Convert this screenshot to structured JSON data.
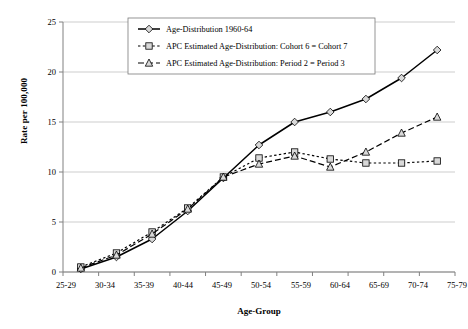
{
  "chart_data": {
    "type": "line",
    "title": "",
    "xlabel": "Age-Group",
    "ylabel": "Rate per 100,000",
    "categories": [
      "25-29",
      "30-34",
      "35-39",
      "40-44",
      "45-49",
      "50-54",
      "55-59",
      "60-64",
      "65-69",
      "70-74",
      "75-79"
    ],
    "ylim": [
      0,
      25
    ],
    "yticks": [
      0,
      5,
      10,
      15,
      20,
      25
    ],
    "grid": true,
    "legend_position": "top-center",
    "series": [
      {
        "name": "Age-Distribution 1960-64",
        "marker": "diamond",
        "line_style": "solid",
        "color": "#000000",
        "values": [
          0.3,
          1.5,
          3.3,
          6.1,
          9.4,
          12.7,
          15.0,
          16.0,
          17.3,
          19.4,
          22.2
        ]
      },
      {
        "name": "APC Estimated Age-Distribution: Cohort 6 = Cohort 7",
        "marker": "square",
        "line_style": "dotted",
        "color": "#000000",
        "values": [
          0.5,
          1.9,
          4.0,
          6.4,
          9.5,
          11.4,
          12.0,
          11.3,
          10.9,
          10.9,
          11.1
        ]
      },
      {
        "name": "APC Estimated Age-Distribution: Period 2 = Period 3",
        "marker": "circle",
        "line_style": "dashed",
        "color": "#000000",
        "values": [
          0.4,
          1.7,
          3.8,
          6.3,
          9.5,
          10.8,
          11.6,
          10.5,
          12.0,
          13.9,
          15.5
        ]
      }
    ]
  },
  "axis": {
    "y_labels": [
      "25",
      "20",
      "15",
      "10",
      "5",
      "0"
    ],
    "x_labels": [
      "25-29",
      "30-34",
      "35-39",
      "40-44",
      "45-49",
      "50-54",
      "55-59",
      "60-64",
      "65-69",
      "70-74",
      "75-79"
    ],
    "y_title": "Rate per 100,000",
    "x_title": "Age-Group"
  },
  "legend": {
    "entries": [
      {
        "label": "Age-Distribution 1960-64"
      },
      {
        "label": "APC Estimated Age-Distribution: Cohort 6 = Cohort 7"
      },
      {
        "label": "APC Estimated Age-Distribution: Period 2 = Period 3"
      }
    ]
  },
  "colors": {
    "line": "#000000",
    "grid": "#b8b8b8",
    "axis": "#808080",
    "marker_fill": "#d9d9d9",
    "background": "#ffffff"
  }
}
